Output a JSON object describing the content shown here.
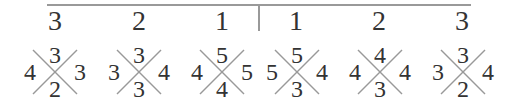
{
  "header": {
    "numbers": [
      "3",
      "2",
      "1",
      "1",
      "2",
      "3"
    ]
  },
  "crosses": [
    {
      "top": "3",
      "left": "4",
      "right": "3",
      "bottom": "2"
    },
    {
      "top": "3",
      "left": "3",
      "right": "4",
      "bottom": "3"
    },
    {
      "top": "5",
      "left": "4",
      "right": "5",
      "bottom": "4"
    },
    {
      "top": "5",
      "left": "5",
      "right": "4",
      "bottom": "3"
    },
    {
      "top": "4",
      "left": "4",
      "right": "4",
      "bottom": "3"
    },
    {
      "top": "3",
      "left": "3",
      "right": "4",
      "bottom": "2"
    }
  ],
  "colors": {
    "line": "#999999",
    "text": "#333333"
  }
}
